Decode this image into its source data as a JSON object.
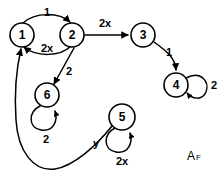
{
  "figure": {
    "caption_main": "A",
    "caption_subscript": "F",
    "background_color": "#ffffff",
    "stroke_color": "#000000"
  },
  "graph": {
    "type": "directed-labeled-graph",
    "nodes": [
      {
        "id": "1",
        "label": "1",
        "cx": 22,
        "cy": 35,
        "r": 12
      },
      {
        "id": "2",
        "label": "2",
        "cx": 72,
        "cy": 35,
        "r": 12
      },
      {
        "id": "3",
        "label": "3",
        "cx": 143,
        "cy": 35,
        "r": 12
      },
      {
        "id": "4",
        "label": "4",
        "cx": 176,
        "cy": 85,
        "r": 12
      },
      {
        "id": "5",
        "label": "5",
        "cx": 122,
        "cy": 117,
        "r": 13
      },
      {
        "id": "6",
        "label": "6",
        "cx": 47,
        "cy": 95,
        "r": 12
      }
    ],
    "edges": [
      {
        "from": "1",
        "to": "2",
        "label": "1",
        "label_x": 47,
        "label_y": 12,
        "shape": "curve-above"
      },
      {
        "from": "2",
        "to": "1",
        "label": "2x",
        "label_x": 47,
        "label_y": 48,
        "shape": "curve-below"
      },
      {
        "from": "2",
        "to": "3",
        "label": "2x",
        "label_x": 105,
        "label_y": 23,
        "shape": "straight"
      },
      {
        "from": "3",
        "to": "4",
        "label": "1",
        "label_x": 168,
        "label_y": 52,
        "shape": "curve"
      },
      {
        "from": "2",
        "to": "6",
        "label": "2",
        "label_x": 68,
        "label_y": 70,
        "shape": "straight-diagonal"
      },
      {
        "from": "5",
        "to": "1",
        "label": "y",
        "label_x": 96,
        "label_y": 143,
        "shape": "long-sweep"
      }
    ],
    "self_loops": [
      {
        "node": "4",
        "label": "2",
        "label_x": 213,
        "label_y": 85,
        "position": "right"
      },
      {
        "node": "6",
        "label": "2",
        "label_x": 47,
        "label_y": 137,
        "position": "below"
      },
      {
        "node": "5",
        "label": "2x",
        "label_x": 122,
        "label_y": 159,
        "position": "below"
      }
    ]
  }
}
